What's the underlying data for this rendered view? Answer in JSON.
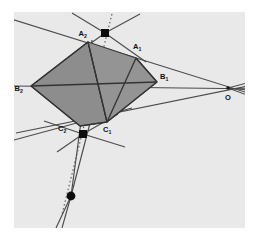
{
  "figure": {
    "type": "geometry-diagram",
    "canvas": {
      "width": 260,
      "height": 237
    },
    "panel": {
      "x": 14,
      "y": 12,
      "width": 231,
      "height": 216,
      "fill": "#e9e9e9"
    },
    "colors": {
      "background": "#ffffff",
      "panel": "#e9e9e9",
      "shade_left": "#8d8d8d",
      "shade_right": "#949494",
      "line": "#4a4a4a",
      "line_heavy": "#333333",
      "dot": "#111111",
      "label": "#111111",
      "marker": "#0d0d0d"
    },
    "labels": [
      {
        "id": "A2",
        "base": "A",
        "sub": "2",
        "x": 78.5,
        "y": 36.0,
        "name": "label-a2"
      },
      {
        "id": "A1",
        "base": "A",
        "sub": "1",
        "x": 133.0,
        "y": 49.0,
        "name": "label-a1"
      },
      {
        "id": "B1",
        "base": "B",
        "sub": "1",
        "x": 160.0,
        "y": 79.0,
        "name": "label-b1"
      },
      {
        "id": "B2",
        "base": "B",
        "sub": "2",
        "x": 14.5,
        "y": 91.0,
        "name": "label-b2"
      },
      {
        "id": "C2",
        "base": "C",
        "sub": "2",
        "x": 58.0,
        "y": 131.0,
        "name": "label-c2"
      },
      {
        "id": "C1",
        "base": "C",
        "sub": "1",
        "x": 103.0,
        "y": 132.0,
        "name": "label-c1"
      },
      {
        "id": "O",
        "base": "O",
        "sub": "",
        "x": 225.0,
        "y": 100.0,
        "name": "label-o"
      }
    ],
    "points": [
      {
        "id": "A2",
        "x": 88.0,
        "y": 42.0,
        "kind": "vertex"
      },
      {
        "id": "A1",
        "x": 136.0,
        "y": 58.0,
        "kind": "vertex"
      },
      {
        "id": "B1",
        "x": 157.0,
        "y": 82.0,
        "kind": "vertex"
      },
      {
        "id": "B2",
        "x": 31.0,
        "y": 86.0,
        "kind": "vertex"
      },
      {
        "id": "C1",
        "x": 107.0,
        "y": 122.0,
        "kind": "vertex"
      },
      {
        "id": "C2",
        "x": 80.0,
        "y": 126.0,
        "kind": "vertex"
      },
      {
        "id": "O",
        "x": 228.0,
        "y": 88.0,
        "kind": "center"
      },
      {
        "id": "P1",
        "x": 105.0,
        "y": 33.0,
        "kind": "marker"
      },
      {
        "id": "P2",
        "x": 83.0,
        "y": 134.0,
        "kind": "marker"
      },
      {
        "id": "P3",
        "x": 71.0,
        "y": 196.0,
        "kind": "marker"
      }
    ],
    "quad_left": "31,86 88,42 107,122 80,126",
    "quad_right": "88,42 136,58 157,82 107,122",
    "dotted_line": {
      "x1": 112.0,
      "y1": 14.0,
      "x2": 62.0,
      "y2": 214.0
    }
  }
}
